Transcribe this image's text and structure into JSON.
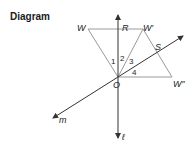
{
  "title": "Diagram",
  "points": {
    "W": "W",
    "R": "R",
    "W_prime": "W′",
    "S": "S",
    "W_double_prime": "W″",
    "O": "O"
  },
  "lines": {
    "m": "m",
    "l": "ℓ"
  },
  "angles": [
    "1",
    "2",
    "3",
    "4"
  ],
  "colors": {
    "segment": "#9a9a9a",
    "axis": "#333333",
    "text": "#222222"
  }
}
